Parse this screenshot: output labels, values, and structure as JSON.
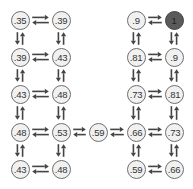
{
  "diagram": {
    "type": "grid-world-value-function",
    "colors": {
      "node_fill": "#f1f1f1",
      "node_border": "#6e6e6e",
      "goal_fill": "#5a5a5a",
      "arrow": "#444444",
      "text": "#333333"
    },
    "nodes": [
      {
        "id": "a1",
        "label": ".35",
        "x": 20,
        "y": 20
      },
      {
        "id": "a2",
        "label": ".39",
        "x": 61,
        "y": 20
      },
      {
        "id": "b1",
        "label": ".39",
        "x": 20,
        "y": 57
      },
      {
        "id": "b2",
        "label": ".43",
        "x": 61,
        "y": 57
      },
      {
        "id": "c1",
        "label": ".43",
        "x": 20,
        "y": 94
      },
      {
        "id": "c2",
        "label": ".48",
        "x": 61,
        "y": 94
      },
      {
        "id": "d1",
        "label": ".48",
        "x": 20,
        "y": 132
      },
      {
        "id": "d2",
        "label": ".53",
        "x": 61,
        "y": 132
      },
      {
        "id": "e1",
        "label": ".43",
        "x": 20,
        "y": 169
      },
      {
        "id": "e2",
        "label": ".48",
        "x": 61,
        "y": 169
      },
      {
        "id": "m",
        "label": ".59",
        "x": 98,
        "y": 132
      },
      {
        "id": "a3",
        "label": ".9",
        "x": 136,
        "y": 20
      },
      {
        "id": "a4",
        "label": "1",
        "x": 174,
        "y": 20,
        "goal": true
      },
      {
        "id": "b3",
        "label": ".81",
        "x": 136,
        "y": 57
      },
      {
        "id": "b4",
        "label": ".9",
        "x": 174,
        "y": 57
      },
      {
        "id": "c3",
        "label": ".73",
        "x": 136,
        "y": 94
      },
      {
        "id": "c4",
        "label": ".81",
        "x": 174,
        "y": 94
      },
      {
        "id": "d3",
        "label": ".66",
        "x": 136,
        "y": 132
      },
      {
        "id": "d4",
        "label": ".73",
        "x": 174,
        "y": 132
      },
      {
        "id": "e3",
        "label": ".59",
        "x": 136,
        "y": 169
      },
      {
        "id": "e4",
        "label": ".66",
        "x": 174,
        "y": 169
      }
    ],
    "edges": [
      [
        "a1",
        "a2"
      ],
      [
        "b1",
        "b2"
      ],
      [
        "c1",
        "c2"
      ],
      [
        "d1",
        "d2"
      ],
      [
        "e1",
        "e2"
      ],
      [
        "a1",
        "b1"
      ],
      [
        "b1",
        "c1"
      ],
      [
        "c1",
        "d1"
      ],
      [
        "d1",
        "e1"
      ],
      [
        "a2",
        "b2"
      ],
      [
        "b2",
        "c2"
      ],
      [
        "c2",
        "d2"
      ],
      [
        "d2",
        "e2"
      ],
      [
        "d2",
        "m"
      ],
      [
        "m",
        "d3"
      ],
      [
        "a3",
        "a4"
      ],
      [
        "b3",
        "b4"
      ],
      [
        "c3",
        "c4"
      ],
      [
        "d3",
        "d4"
      ],
      [
        "e3",
        "e4"
      ],
      [
        "a3",
        "b3"
      ],
      [
        "b3",
        "c3"
      ],
      [
        "c3",
        "d3"
      ],
      [
        "d3",
        "e3"
      ],
      [
        "a4",
        "b4"
      ],
      [
        "b4",
        "c4"
      ],
      [
        "c4",
        "d4"
      ],
      [
        "d4",
        "e4"
      ]
    ]
  }
}
